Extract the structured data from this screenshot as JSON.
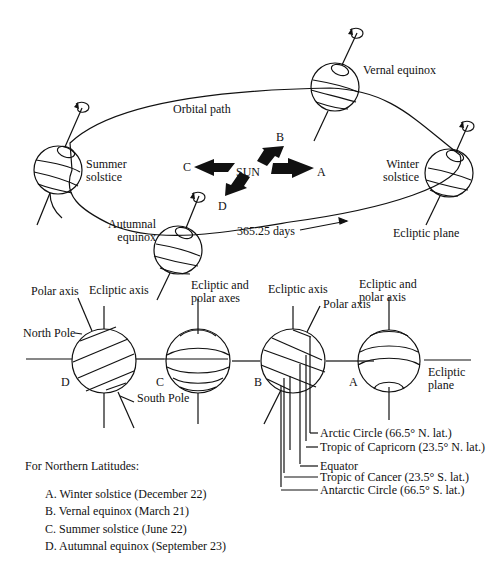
{
  "orbit": {
    "orbital_path_label": "Orbital path",
    "days_label": "365.25 days",
    "sun_label": "SUN",
    "arrows": [
      "A",
      "B",
      "C",
      "D"
    ],
    "positions": {
      "summer": [
        "Summer",
        "solstice"
      ],
      "vernal": "Vernal equinox",
      "winter": [
        "Winter",
        "solstice"
      ],
      "autumnal": [
        "Autumnal",
        "equinox"
      ],
      "ecliptic_plane": "Ecliptic plane"
    }
  },
  "globes": {
    "D": {
      "letter": "D",
      "polar_axis": "Polar axis",
      "ecliptic_axis": "Ecliptic axis",
      "north_pole": "North Pole",
      "south_pole": "South Pole"
    },
    "C": {
      "letter": "C",
      "axes": [
        "Ecliptic and",
        "polar axes"
      ]
    },
    "B": {
      "letter": "B",
      "ecliptic_axis": "Ecliptic axis",
      "polar_axis": "Polar axis",
      "latitudes": [
        "Arctic Circle (66.5° N. lat.)",
        "Tropic of Capricorn (23.5° N. lat.)",
        "Equator",
        "Tropic  of Cancer (23.5° S. lat.)",
        "Antarctic Circle (66.5° S. lat.)"
      ]
    },
    "A": {
      "letter": "A",
      "axes": [
        "Ecliptic and",
        "polar axis"
      ],
      "ecliptic_plane": [
        "Ecliptic",
        "plane"
      ]
    }
  },
  "legend": {
    "title": "For Northern Latitudes:",
    "items": [
      "A. Winter solstice (December 22)",
      "B. Vernal equinox (March 21)",
      "C. Summer solstice (June 22)",
      "D. Autumnal equinox (September 23)"
    ]
  }
}
